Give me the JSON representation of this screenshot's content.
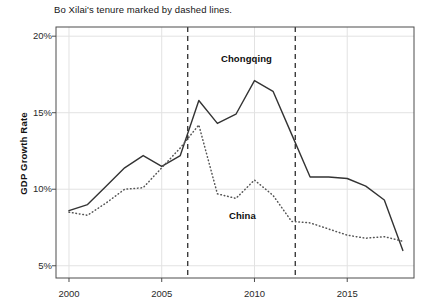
{
  "chart_data": {
    "type": "line",
    "title": "Bo Xilai's tenure marked by dashed lines.",
    "xlabel": "",
    "ylabel": "GDP Growth Rate",
    "xlim": [
      1999.3,
      2018.6
    ],
    "ylim": [
      4.2,
      20.6
    ],
    "grid": true,
    "legend_position": "inline-annotation",
    "x_ticks": [
      2000,
      2005,
      2010,
      2015
    ],
    "x_tick_labels": [
      "2000",
      "2005",
      "2010",
      "2015"
    ],
    "y_ticks": [
      5,
      10,
      15,
      20
    ],
    "y_tick_labels": [
      "5%",
      "10%",
      "15%",
      "20%"
    ],
    "series": [
      {
        "name": "Chongqing",
        "style": "solid",
        "color": "#333333",
        "label_x": 2008.6,
        "label_y": 18.6,
        "x": [
          2000,
          2001,
          2002,
          2003,
          2004,
          2005,
          2006,
          2007,
          2008,
          2009,
          2010,
          2011,
          2012,
          2013,
          2014,
          2015,
          2016,
          2017,
          2018
        ],
        "values": [
          8.6,
          9.0,
          10.2,
          11.4,
          12.2,
          11.5,
          12.2,
          15.8,
          14.3,
          14.9,
          17.1,
          16.4,
          13.6,
          10.8,
          10.8,
          10.7,
          10.2,
          9.3,
          6.0
        ]
      },
      {
        "name": "China",
        "style": "dotted",
        "color": "#555555",
        "label_x": 2009.7,
        "label_y": 8.6,
        "x": [
          2000,
          2001,
          2002,
          2003,
          2004,
          2005,
          2006,
          2007,
          2008,
          2009,
          2010,
          2011,
          2012,
          2013,
          2014,
          2015,
          2016,
          2017,
          2018
        ],
        "values": [
          8.5,
          8.3,
          9.1,
          10.0,
          10.1,
          11.4,
          12.7,
          14.2,
          9.7,
          9.4,
          10.6,
          9.6,
          7.9,
          7.8,
          7.4,
          7.0,
          6.8,
          6.9,
          6.6
        ]
      }
    ],
    "annotations": [
      {
        "type": "vline",
        "name": "bo-xilai-tenure-start",
        "x": 2006.4,
        "style": "dashed"
      },
      {
        "type": "vline",
        "name": "bo-xilai-tenure-end",
        "x": 2012.2,
        "style": "dashed"
      }
    ]
  }
}
